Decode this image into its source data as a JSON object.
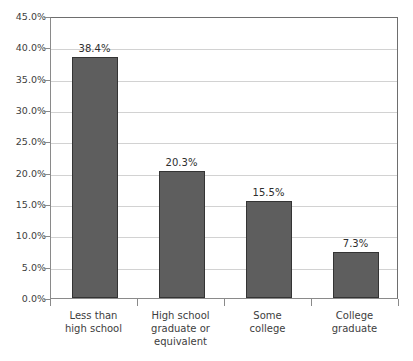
{
  "chart_data": {
    "type": "bar",
    "title": "",
    "subtitle": "",
    "xlabel": "",
    "ylabel": "",
    "categories": [
      "Less than\nhigh school",
      "High school\ngraduate or\nequivalent",
      "Some\ncollege",
      "College\ngraduate"
    ],
    "category_lines": [
      [
        "Less than",
        "high school"
      ],
      [
        "High school",
        "graduate or",
        "equivalent"
      ],
      [
        "Some",
        "college"
      ],
      [
        "College",
        "graduate"
      ]
    ],
    "values": [
      38.4,
      20.3,
      15.5,
      7.3
    ],
    "data_labels": [
      "38.4%",
      "20.3%",
      "15.5%",
      "7.3%"
    ],
    "ylim": [
      0,
      45
    ],
    "ytick_values": [
      0,
      5,
      10,
      15,
      20,
      25,
      30,
      35,
      40,
      45
    ],
    "ytick_labels": [
      "0.0%",
      "5.0%",
      "10.0%",
      "15.0%",
      "20.0%",
      "25.0%",
      "30.0%",
      "35.0%",
      "40.0%",
      "45.0%"
    ],
    "grid": true,
    "grid_axis": "y",
    "legend": false,
    "legend_position": "none",
    "colors": {
      "bar_fill": "#5e5e5e",
      "bar_edge": "#343434",
      "gridline": "#d2d2d2",
      "axis": "#8a8a8a",
      "plot_border": "#6e6e6e",
      "text": "#3d3d3d",
      "background": "#ffffff"
    }
  }
}
